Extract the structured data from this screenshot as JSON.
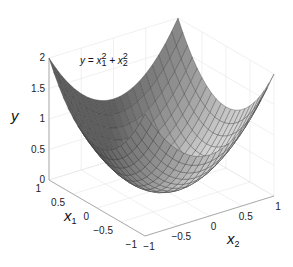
{
  "chart_data": {
    "type": "surface",
    "title": "",
    "annotation": "y = x1^2 + x2^2",
    "annotation_parts": {
      "lhs": "y = x",
      "sub1": "1",
      "sup1": "2",
      "plus": " + x",
      "sub2": "2",
      "sup2": "2"
    },
    "xlabel": "x1",
    "x2label": "x2",
    "ylabel": "y",
    "x1_range": [
      -1,
      1
    ],
    "x2_range": [
      -1,
      1
    ],
    "ylim": [
      0,
      2
    ],
    "x1_ticks": [
      "1",
      "0.5",
      "0",
      "-0.5",
      "-1"
    ],
    "x2_ticks": [
      "-1",
      "-0.5",
      "0",
      "0.5",
      "1"
    ],
    "y_ticks": [
      "0",
      "0.5",
      "1",
      "1.5",
      "2"
    ],
    "grid_resolution": 21,
    "grid": true,
    "colormap": "gray",
    "sample_values": [
      {
        "x1": -1,
        "x2": -1,
        "y": 2
      },
      {
        "x1": -1,
        "x2": 1,
        "y": 2
      },
      {
        "x1": 1,
        "x2": -1,
        "y": 2
      },
      {
        "x1": 1,
        "x2": 1,
        "y": 2
      },
      {
        "x1": 0,
        "x2": 0,
        "y": 0
      },
      {
        "x1": 1,
        "x2": 0,
        "y": 1
      },
      {
        "x1": 0,
        "x2": 1,
        "y": 1
      },
      {
        "x1": 0.5,
        "x2": 0.5,
        "y": 0.5
      }
    ]
  },
  "labels": {
    "y": "y",
    "x1": "x",
    "x1_sub": "1",
    "x2": "x",
    "x2_sub": "2"
  }
}
